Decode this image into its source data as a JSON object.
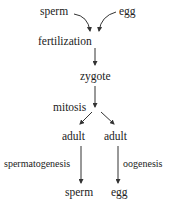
{
  "diagram": {
    "type": "life-cycle flowchart",
    "nodes": {
      "sperm_top": "sperm",
      "egg_top": "egg",
      "fertilization": "fertilization",
      "zygote": "zygote",
      "mitosis": "mitosis",
      "adult_left": "adult",
      "adult_right": "adult",
      "spermatogenesis": "spermatogenesis",
      "oogenesis": "oogenesis",
      "sperm_bottom": "sperm",
      "egg_bottom": "egg"
    },
    "edges": [
      [
        "sperm",
        "fertilization"
      ],
      [
        "egg",
        "fertilization"
      ],
      [
        "fertilization",
        "zygote"
      ],
      [
        "zygote",
        "adult (left)"
      ],
      [
        "zygote",
        "adult (right)"
      ],
      [
        "adult (left)",
        "sperm"
      ],
      [
        "adult (right)",
        "egg"
      ]
    ],
    "edge_labels": {
      "zygote_to_adults": "mitosis",
      "left_adult_to_sperm": "spermatogenesis",
      "right_adult_to_egg": "oogenesis"
    },
    "colors": {
      "text": "#222222",
      "arrow": "#333333",
      "background": "#ffffff"
    }
  }
}
